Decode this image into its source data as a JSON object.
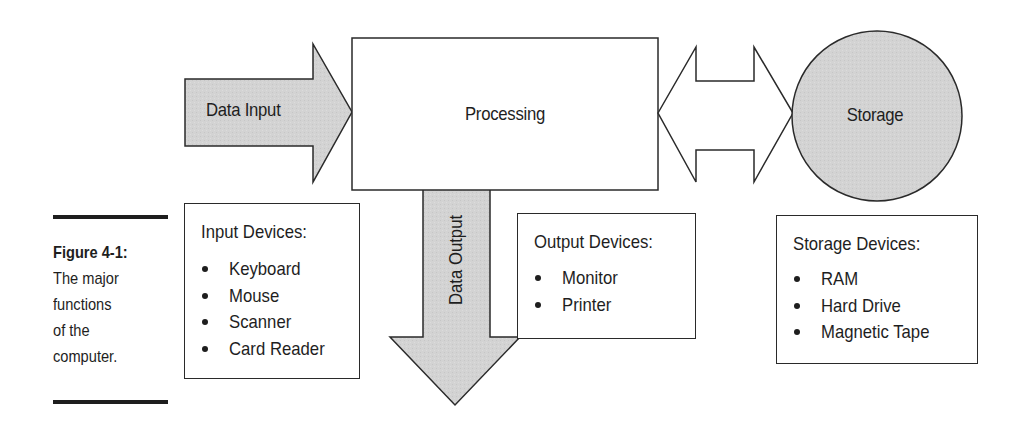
{
  "diagram": {
    "nodes": {
      "data_input": {
        "label": "Data Input",
        "shape": "right-arrow",
        "fill": "#d4d4d4"
      },
      "processing": {
        "label": "Processing",
        "shape": "rectangle",
        "fill": "#ffffff"
      },
      "storage": {
        "label": "Storage",
        "shape": "circle",
        "fill": "#d4d4d4"
      },
      "data_output": {
        "label": "Data Output",
        "shape": "down-arrow",
        "fill": "#d4d4d4"
      },
      "bidirectional": {
        "label": "",
        "shape": "double-arrow",
        "fill": "#ffffff"
      }
    },
    "edges": [
      {
        "from": "data_input",
        "to": "processing"
      },
      {
        "from": "processing",
        "to": "storage",
        "bidirectional": true
      },
      {
        "from": "processing",
        "to": "data_output"
      }
    ],
    "stroke_color": "#2a2a2a"
  },
  "device_boxes": {
    "input": {
      "title": "Input Devices:",
      "items": [
        "Keyboard",
        "Mouse",
        "Scanner",
        "Card Reader"
      ]
    },
    "output": {
      "title": "Output Devices:",
      "items": [
        "Monitor",
        "Printer"
      ]
    },
    "storage": {
      "title": "Storage Devices:",
      "items": [
        "RAM",
        "Hard Drive",
        "Magnetic Tape"
      ]
    }
  },
  "caption": {
    "figure_number": "Figure 4-1:",
    "lines": [
      "The major",
      "functions",
      "of the",
      "computer."
    ]
  }
}
